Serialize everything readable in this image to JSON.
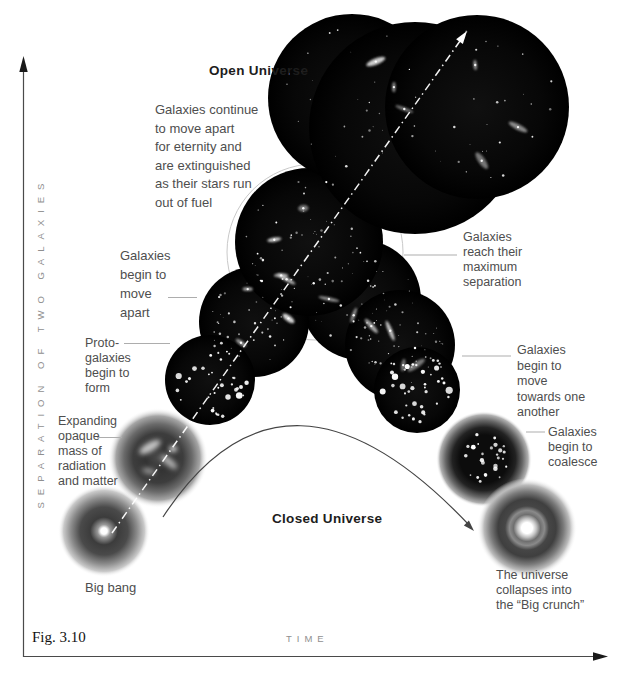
{
  "figure_label": "Fig. 3.10",
  "axes": {
    "x_label": "TIME",
    "y_label": "SEPARATION OF TWO GALAXIES"
  },
  "scenarios": {
    "open": {
      "title": "Open Universe",
      "outcome": "Galaxies continue\nto move apart\nfor eternity and\nare extinguished\nas their stars run\nout of fuel"
    },
    "closed": {
      "title": "Closed Universe",
      "outcome": "The universe\ncollapses into\nthe “Big crunch”"
    }
  },
  "stages": {
    "big_bang": "Big bang",
    "expanding_mass": "Expanding\nopaque\nmass of\nradiation\nand matter",
    "proto_galaxies": "Proto-\ngalaxies\nbegin to\nform",
    "move_apart": "Galaxies\nbegin to\nmove\napart",
    "max_separation": "Galaxies\nreach their\nmaximum\nseparation",
    "move_towards": "Galaxies\nbegin to\nmove\ntowards one\nanother",
    "coalesce": "Galaxies\nbegin to\ncoalesce"
  },
  "colors": {
    "background": "#ffffff",
    "galaxy_circle": "#000000",
    "annotation_text": "#4e4e4e",
    "muted_label": "#8f8f8f",
    "open_trajectory": "#ffffff",
    "closed_trajectory": "#444444"
  }
}
